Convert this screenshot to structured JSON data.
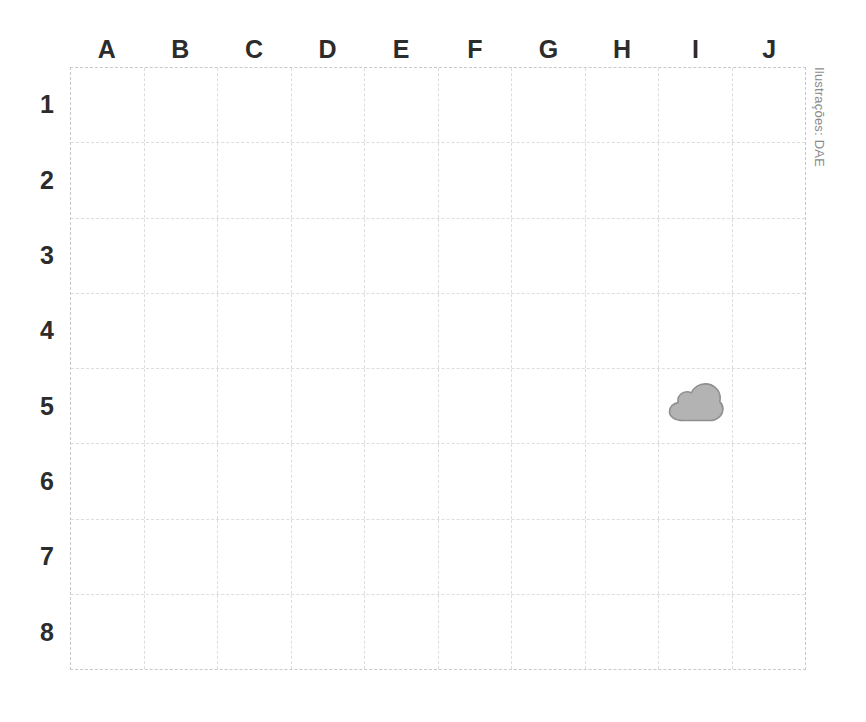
{
  "figure": {
    "type": "coordinate-grid",
    "credit": "Ilustrações: DAE",
    "background_color": "#ffffff",
    "grid_line_color": "#dddddd",
    "grid_border_color": "#c8c8c8",
    "label_color": "#2c2c2c",
    "credit_color": "#8a8a8a"
  },
  "grid": {
    "columns": [
      "A",
      "B",
      "C",
      "D",
      "E",
      "F",
      "G",
      "H",
      "I",
      "J"
    ],
    "rows": [
      "1",
      "2",
      "3",
      "4",
      "5",
      "6",
      "7",
      "8"
    ],
    "column_count": 10,
    "row_count": 8
  },
  "items": [
    {
      "name": "cloud",
      "label": "cloud",
      "column": "I",
      "row": "5",
      "cell": "I5",
      "fill_color": "#b3b3b3",
      "outline_color": "#8f8f8f"
    }
  ],
  "chart_data": {
    "type": "table",
    "title": "",
    "xlabel": "",
    "ylabel": "",
    "categories": [
      "A",
      "B",
      "C",
      "D",
      "E",
      "F",
      "G",
      "H",
      "I",
      "J"
    ],
    "rows": [
      "1",
      "2",
      "3",
      "4",
      "5",
      "6",
      "7",
      "8"
    ],
    "occupied_cells": [
      {
        "cell": "I5",
        "column": "I",
        "row": "5",
        "content": "cloud"
      }
    ],
    "grid": "on",
    "legend": "none"
  }
}
